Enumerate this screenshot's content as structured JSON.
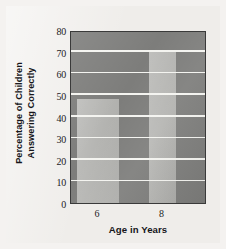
{
  "chart_data": {
    "type": "bar",
    "title": "",
    "categories": [
      "6",
      "8"
    ],
    "values": [
      48,
      70
    ],
    "series": [
      {
        "name": "Percentage of Children Answering Correctly",
        "values": [
          48,
          70
        ]
      }
    ],
    "xlabel": "Age in Years",
    "ylabel_line1": "Percentage of Children",
    "ylabel_line2": "Answering Correctly",
    "ylabel": "Percentage of Children Answering Correctly",
    "ylim": [
      0,
      80
    ],
    "ytick_values": [
      0,
      10,
      20,
      30,
      40,
      50,
      60,
      70,
      80
    ],
    "ytick_labels": [
      "0",
      "10",
      "20",
      "30",
      "40",
      "50",
      "60",
      "70",
      "80"
    ],
    "xtick_labels": [
      "6",
      "8"
    ],
    "grid": true,
    "grid_orientation": "horizontal",
    "legend": false,
    "legend_position": "none",
    "colors": {
      "page_background": "#f0eeeb",
      "panel_background": "#7d7d7b",
      "bar_fill": "#b2b2af",
      "gridline": "#f4f4f0",
      "axis_border": "#3a3a3a",
      "text": "#16161a"
    }
  }
}
